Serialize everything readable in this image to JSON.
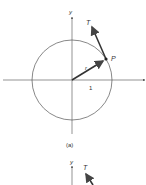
{
  "figure": {
    "top": {
      "y_axis_label": "y",
      "tangent_label": "T",
      "point_label": "P",
      "radius_label": "r",
      "unit_label": "1",
      "caption": "(a)"
    },
    "bottom": {
      "y_axis_label": "y",
      "tangent_label": "T"
    }
  },
  "colors": {
    "line": "#555555",
    "vector": "#333333",
    "background": "#ffffff"
  }
}
